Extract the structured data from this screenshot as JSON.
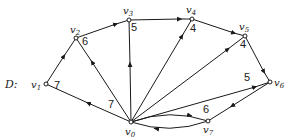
{
  "diagram": {
    "name": "D",
    "name_label": "D:",
    "nodes": [
      {
        "id": "v0",
        "label": "v",
        "sub": "0",
        "x": 131,
        "y": 122
      },
      {
        "id": "v1",
        "label": "v",
        "sub": "1",
        "x": 46,
        "y": 84
      },
      {
        "id": "v2",
        "label": "v",
        "sub": "2",
        "x": 76,
        "y": 38
      },
      {
        "id": "v3",
        "label": "v",
        "sub": "3",
        "x": 129,
        "y": 20
      },
      {
        "id": "v4",
        "label": "v",
        "sub": "4",
        "x": 192,
        "y": 19
      },
      {
        "id": "v5",
        "label": "v",
        "sub": "5",
        "x": 245,
        "y": 36
      },
      {
        "id": "v6",
        "label": "v",
        "sub": "6",
        "x": 270,
        "y": 82
      },
      {
        "id": "v7",
        "label": "v",
        "sub": "7",
        "x": 208,
        "y": 121
      }
    ],
    "edges": [
      {
        "from": "v0",
        "to": "v1"
      },
      {
        "from": "v1",
        "to": "v2"
      },
      {
        "from": "v0",
        "to": "v2"
      },
      {
        "from": "v2",
        "to": "v3"
      },
      {
        "from": "v0",
        "to": "v3"
      },
      {
        "from": "v3",
        "to": "v4"
      },
      {
        "from": "v0",
        "to": "v4"
      },
      {
        "from": "v4",
        "to": "v5"
      },
      {
        "from": "v0",
        "to": "v5"
      },
      {
        "from": "v5",
        "to": "v6"
      },
      {
        "from": "v0",
        "to": "v6"
      },
      {
        "from": "v6",
        "to": "v7"
      },
      {
        "from": "v0",
        "to": "v7",
        "curved": "upper"
      },
      {
        "from": "v7",
        "to": "v0",
        "curved": "lower"
      }
    ],
    "weights": [
      {
        "near": "v1",
        "value": "7"
      },
      {
        "near": "v2",
        "value": "6"
      },
      {
        "near": "v3",
        "value": "5"
      },
      {
        "near": "v4",
        "value": "4"
      },
      {
        "near": "v5",
        "value": "4"
      },
      {
        "near": "v6",
        "value": "5"
      },
      {
        "near": "v7",
        "value": "6"
      },
      {
        "near": "v0",
        "value": "7"
      }
    ]
  }
}
